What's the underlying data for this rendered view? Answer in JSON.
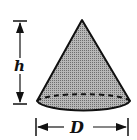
{
  "diagram": {
    "shape": "cone",
    "labels": {
      "height": "h",
      "diameter": "D"
    },
    "colors": {
      "fill": "#9a9a9a",
      "stroke": "#111111",
      "background": "#ffffff"
    }
  }
}
